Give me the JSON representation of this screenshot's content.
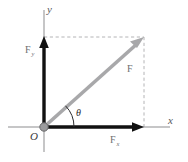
{
  "figure": {
    "background_color": "#ffffff",
    "axes": {
      "x_label": "x",
      "y_label": "y",
      "origin_label": "O",
      "axis_color": "#8d8d8f"
    },
    "vectors": [
      {
        "name": "resultant-force",
        "label": "F",
        "subscript": "",
        "color": "#a8a8aa",
        "description": "diagonal resultant force vector"
      },
      {
        "name": "force-y-component",
        "label": "F",
        "subscript": "y",
        "color": "#111111",
        "description": "vertical component along y axis"
      },
      {
        "name": "force-x-component",
        "label": "F",
        "subscript": "x",
        "color": "#111111",
        "description": "horizontal component along x axis"
      }
    ],
    "angle": {
      "label": "θ",
      "name": "theta-angle",
      "color": "#2b2b2d"
    },
    "guides": {
      "color": "#b4b4b6",
      "style": "dashed",
      "description": "dashed rectangle completing the parallelogram"
    },
    "origin_dot": {
      "fill": "#9a9a9c",
      "stroke": "#6a6a6c"
    }
  }
}
